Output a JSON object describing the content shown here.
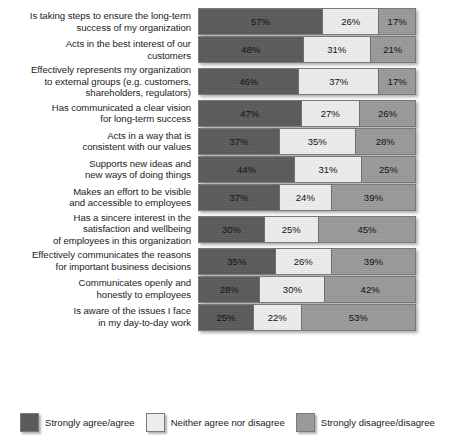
{
  "chart_data": {
    "type": "bar",
    "subtype": "stacked-horizontal-100pct",
    "title": "",
    "subtitle": "",
    "xlabel": "",
    "ylabel": "",
    "xlim": [
      0,
      100
    ],
    "grid": false,
    "legend_position": "bottom",
    "units": "%",
    "categories": [
      "Is taking steps to ensure the long-term success of my organization",
      "Acts in the best interest of our customers",
      "Effectively represents my organization to external groups (e.g. customers, shareholders, regulators)",
      "Has communicated a clear vision for long-term success",
      "Acts in a way that is consistent with our values",
      "Supports new ideas and new ways of doing things",
      "Makes an effort to be visible and accessible to employees",
      "Has a sincere interest in the satisfaction and wellbeing of employees in this organization",
      "Effectively communicates the reasons for important business decisions",
      "Communicates openly and honestly to employees",
      "Is aware of the issues I face in my day-to-day work"
    ],
    "category_lines": [
      [
        "Is taking steps to ensure the long-term",
        "success of my organization"
      ],
      [
        "Acts in the best interest of our",
        "customers"
      ],
      [
        "Effectively represents my organization",
        "to external groups (e.g. customers,",
        "shareholders, regulators)"
      ],
      [
        "Has communicated a clear vision",
        "for long-term success"
      ],
      [
        "Acts in a way that is",
        "consistent with our values"
      ],
      [
        "Supports new ideas and",
        "new ways of doing things"
      ],
      [
        "Makes an effort to be visible",
        "and accessible to employees"
      ],
      [
        "Has a sincere interest in the",
        "satisfaction and wellbeing",
        "of employees in this organization"
      ],
      [
        "Effectively communicates the reasons",
        "for important business decisions"
      ],
      [
        "Communicates openly and",
        "honestly to employees"
      ],
      [
        "Is aware of the issues I face",
        "in my day-to-day work"
      ]
    ],
    "series": [
      {
        "name": "Strongly agree/agree",
        "color": "#5b5b5b",
        "values": [
          57,
          48,
          46,
          47,
          37,
          44,
          37,
          30,
          35,
          28,
          25
        ]
      },
      {
        "name": "Neither agree nor disagree",
        "color": "#ededed",
        "values": [
          26,
          31,
          37,
          27,
          35,
          31,
          24,
          25,
          26,
          30,
          22
        ]
      },
      {
        "name": "Strongly disagree/disagree",
        "color": "#9a9a9a",
        "values": [
          17,
          21,
          17,
          26,
          28,
          25,
          39,
          45,
          39,
          42,
          53
        ]
      }
    ],
    "data_labels": [
      [
        "57%",
        "26%",
        "17%"
      ],
      [
        "48%",
        "31%",
        "21%"
      ],
      [
        "46%",
        "37%",
        "17%"
      ],
      [
        "47%",
        "27%",
        "26%"
      ],
      [
        "37%",
        "35%",
        "28%"
      ],
      [
        "44%",
        "31%",
        "25%"
      ],
      [
        "37%",
        "24%",
        "39%"
      ],
      [
        "30%",
        "25%",
        "45%"
      ],
      [
        "35%",
        "26%",
        "39%"
      ],
      [
        "28%",
        "30%",
        "42%"
      ],
      [
        "25%",
        "22%",
        "53%"
      ]
    ]
  },
  "legend": {
    "items": [
      {
        "label": "Strongly agree/agree",
        "color": "#5b5b5b",
        "swatch_class": "s0"
      },
      {
        "label": "Neither agree nor disagree",
        "color": "#ededed",
        "swatch_class": "s1"
      },
      {
        "label": "Strongly disagree/disagree",
        "color": "#9a9a9a",
        "swatch_class": "s2"
      }
    ]
  }
}
